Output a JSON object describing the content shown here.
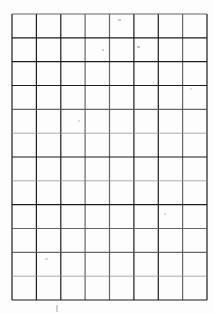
{
  "document": {
    "kind": "scanned-blank-grid",
    "title": "Blank ruled grid sheet",
    "caption": "",
    "page_background": "#fdfdfd",
    "paper_tone": "#ffffff"
  },
  "grid": {
    "columns": 8,
    "rows": 12,
    "left": 12,
    "top": 14,
    "right": 207,
    "bottom": 300,
    "cell_width": 24.375,
    "cell_height": 23.833,
    "line_color_dark": "#1c1c1c",
    "line_color_mid": "#555555",
    "line_color_light": "#8d8d8d",
    "line_width_main": 1.2,
    "line_width_faint": 1.0,
    "x_positions": [
      12,
      36.4,
      60.8,
      85.1,
      109.5,
      133.9,
      158.3,
      182.6,
      207
    ],
    "y_positions": [
      14,
      37.8,
      61.7,
      85.5,
      109.3,
      133.2,
      157,
      180.8,
      204.7,
      228.5,
      252.3,
      276.2,
      300
    ],
    "vertical_line_tones": [
      "dark",
      "dark",
      "dark",
      "mid",
      "mid",
      "dark",
      "dark",
      "mid",
      "dark"
    ],
    "horizontal_line_tones": [
      "mid",
      "dark",
      "dark",
      "dark",
      "mid",
      "light",
      "dark",
      "light",
      "dark",
      "mid",
      "mid",
      "light",
      "dark"
    ]
  },
  "artifacts": {
    "description": "faint scanner speckles and stray marks on the paper",
    "speckles": [
      {
        "x": 118,
        "y": 19,
        "w": 3,
        "h": 2,
        "tone": "#c9c9c9"
      },
      {
        "x": 137,
        "y": 46,
        "w": 3,
        "h": 2,
        "tone": "#c4c4c4"
      },
      {
        "x": 102,
        "y": 49,
        "w": 2,
        "h": 2,
        "tone": "#d2d2d2"
      },
      {
        "x": 56,
        "y": 305,
        "w": 2,
        "h": 7,
        "tone": "#cfcfcf"
      },
      {
        "x": 78,
        "y": 120,
        "w": 2,
        "h": 2,
        "tone": "#dcdcdc"
      },
      {
        "x": 164,
        "y": 213,
        "w": 2,
        "h": 2,
        "tone": "#dadada"
      },
      {
        "x": 45,
        "y": 258,
        "w": 3,
        "h": 2,
        "tone": "#d8d8d8"
      },
      {
        "x": 190,
        "y": 88,
        "w": 2,
        "h": 2,
        "tone": "#dedede"
      }
    ]
  }
}
